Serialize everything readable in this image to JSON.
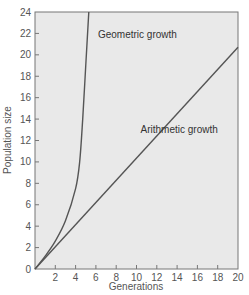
{
  "chart_data": {
    "type": "line",
    "title": "",
    "xlabel": "Generations",
    "ylabel": "Population size",
    "xlim": [
      0,
      20
    ],
    "ylim": [
      0,
      24
    ],
    "x_ticks": [
      2,
      4,
      6,
      8,
      10,
      12,
      14,
      16,
      18,
      20
    ],
    "y_ticks": [
      0,
      2,
      4,
      6,
      8,
      10,
      12,
      14,
      16,
      18,
      20,
      22,
      24
    ],
    "grid": false,
    "legend": null,
    "series": [
      {
        "name": "Geometric growth",
        "x": [
          0,
          1,
          2,
          3,
          4,
          4.4,
          4.7,
          5.0,
          5.3
        ],
        "y": [
          0,
          1.2,
          2.6,
          4.5,
          7.5,
          10,
          14,
          19,
          24
        ]
      },
      {
        "name": "Arithmetic growth",
        "x": [
          0,
          20
        ],
        "y": [
          0,
          20.7
        ]
      }
    ],
    "annotations": [
      {
        "text": "Geometric growth",
        "x": 6.2,
        "y": 21.6
      },
      {
        "text": "Arithmetic growth",
        "x": 10.4,
        "y": 12.7
      }
    ]
  },
  "style": {
    "plot_background": "#e9e9e9",
    "line_color": "#555555",
    "axis_color": "#777777",
    "text_color": "#555555"
  }
}
